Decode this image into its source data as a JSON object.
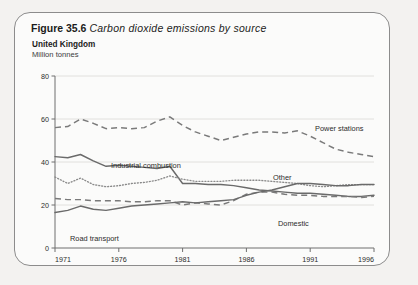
{
  "figure": {
    "label": "Figure 35.6",
    "title": "Carbon dioxide emissions by source",
    "country": "United Kingdom",
    "units": "Million tonnes"
  },
  "colors": {
    "card_border": "#8c8c8c",
    "card_background": "#fbfbfa",
    "page_background": "#f3f2f0",
    "gridline": "#dcdad6",
    "axis": "#6e6e6e",
    "line": "#6a6a6a"
  },
  "chart_data": {
    "type": "line",
    "title": "Carbon dioxide emissions by source",
    "subtitle": "United Kingdom",
    "xlabel": "",
    "ylabel": "Million tonnes",
    "xlim": [
      1971,
      1996
    ],
    "ylim": [
      0,
      80
    ],
    "yticks": [
      0,
      20,
      40,
      60,
      80
    ],
    "xticks": [
      1971,
      1976,
      1981,
      1986,
      1991,
      1996
    ],
    "grid": true,
    "legend_position": "inline-annotations",
    "x": [
      1971,
      1972,
      1973,
      1974,
      1975,
      1976,
      1977,
      1978,
      1979,
      1980,
      1981,
      1982,
      1983,
      1984,
      1985,
      1986,
      1987,
      1988,
      1989,
      1990,
      1991,
      1992,
      1993,
      1994,
      1995,
      1996
    ],
    "series": [
      {
        "name": "Power stations",
        "style": "dashed",
        "label": "Power stations",
        "values": [
          56,
          56.5,
          60,
          58,
          55.5,
          56,
          55.5,
          56,
          59,
          61,
          57,
          54,
          52,
          50,
          51.5,
          53,
          54,
          54,
          53.5,
          54.5,
          52,
          49,
          46,
          44.5,
          43.5,
          42.5
        ]
      },
      {
        "name": "Industrial combustion",
        "style": "solid",
        "label": "Industrial combustion",
        "values": [
          42.5,
          42,
          43.5,
          40.5,
          38,
          38.5,
          38,
          37.5,
          37,
          38,
          30,
          30,
          29.5,
          29.5,
          29,
          28,
          27,
          26.5,
          26,
          25.5,
          25.5,
          25,
          24.5,
          24,
          24,
          24.5
        ]
      },
      {
        "name": "Other",
        "style": "dotted",
        "label": "Other",
        "values": [
          33,
          30,
          32.5,
          29.5,
          28.5,
          29,
          30,
          30.5,
          31.5,
          33.5,
          32,
          31,
          31,
          31,
          31.5,
          31.5,
          31.5,
          31,
          30.5,
          30,
          29,
          28.5,
          29,
          29.5,
          29.5,
          29.5
        ]
      },
      {
        "name": "Domestic",
        "style": "dashed",
        "label": "Domestic",
        "values": [
          23,
          22.5,
          22.5,
          22,
          22,
          22,
          21.5,
          21.5,
          22,
          22,
          20,
          21,
          20.5,
          20,
          22,
          25,
          26,
          26,
          25,
          24.5,
          24.5,
          24,
          24,
          24,
          23.5,
          24
        ]
      },
      {
        "name": "Road transport",
        "style": "solid",
        "label": "Road transport",
        "values": [
          16.5,
          17.5,
          19.5,
          18,
          17.5,
          18.5,
          19.5,
          20,
          20.5,
          21,
          21.5,
          21,
          21.5,
          22,
          22.5,
          24.5,
          26,
          27,
          28.5,
          30,
          30,
          29.5,
          29,
          29,
          29.5,
          29.5
        ]
      }
    ]
  },
  "annotations": [
    {
      "text": "Power stations",
      "series": "Power stations"
    },
    {
      "text": "Industrial combustion",
      "series": "Industrial combustion"
    },
    {
      "text": "Other",
      "series": "Other"
    },
    {
      "text": "Domestic",
      "series": "Domestic"
    },
    {
      "text": "Road transport",
      "series": "Road transport"
    }
  ]
}
